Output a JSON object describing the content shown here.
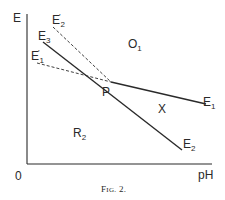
{
  "figure": {
    "caption_prefix": "F",
    "caption_smallcaps": "IG.",
    "caption_number": "2."
  },
  "axes": {
    "y_label": "E",
    "x_label": "pH",
    "origin_label": "0"
  },
  "point": {
    "label": "P"
  },
  "lines": {
    "e1": {
      "base": "E",
      "sub": "1",
      "style": "solid"
    },
    "e2": {
      "base": "E",
      "sub": "2",
      "style": "solid"
    },
    "e3": {
      "base": "E",
      "sub": "3",
      "style": "solid"
    },
    "e1_prime": {
      "base": "E",
      "prime": "′",
      "sub": "1",
      "style": "dashed"
    },
    "e2_prime": {
      "base": "E",
      "prime": "′",
      "sub": "2",
      "style": "dashed"
    }
  },
  "regions": {
    "o1": {
      "base": "O",
      "sub": "1"
    },
    "r2": {
      "base": "R",
      "sub": "2"
    },
    "x": {
      "label": "X"
    }
  },
  "colors": {
    "ink": "#2a2a2a",
    "background": "#ffffff"
  }
}
